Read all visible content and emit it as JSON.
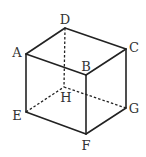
{
  "diagram": {
    "type": "cube",
    "colors": {
      "stroke": "#222222",
      "label": "#333333",
      "background": "#ffffff"
    },
    "vertices": {
      "A": {
        "label": "A",
        "x": 26,
        "y": 54,
        "label_x": 17,
        "label_y": 53
      },
      "B": {
        "label": "B",
        "x": 86,
        "y": 75,
        "label_x": 86,
        "label_y": 67
      },
      "C": {
        "label": "C",
        "x": 126,
        "y": 49,
        "label_x": 134,
        "label_y": 48
      },
      "D": {
        "label": "D",
        "x": 65,
        "y": 28,
        "label_x": 65,
        "label_y": 20
      },
      "E": {
        "label": "E",
        "x": 26,
        "y": 112,
        "label_x": 17,
        "label_y": 116
      },
      "F": {
        "label": "F",
        "x": 86,
        "y": 134,
        "label_x": 86,
        "label_y": 146
      },
      "G": {
        "label": "G",
        "x": 126,
        "y": 108,
        "label_x": 134,
        "label_y": 109
      },
      "H": {
        "label": "H",
        "x": 64,
        "y": 87,
        "label_x": 66,
        "label_y": 98
      }
    },
    "solid_edges": [
      [
        "A",
        "D"
      ],
      [
        "D",
        "C"
      ],
      [
        "C",
        "B"
      ],
      [
        "B",
        "A"
      ],
      [
        "A",
        "E"
      ],
      [
        "B",
        "F"
      ],
      [
        "C",
        "G"
      ],
      [
        "E",
        "F"
      ],
      [
        "F",
        "G"
      ]
    ],
    "dashed_edges": [
      [
        "D",
        "H"
      ],
      [
        "E",
        "H"
      ],
      [
        "H",
        "G"
      ]
    ]
  }
}
